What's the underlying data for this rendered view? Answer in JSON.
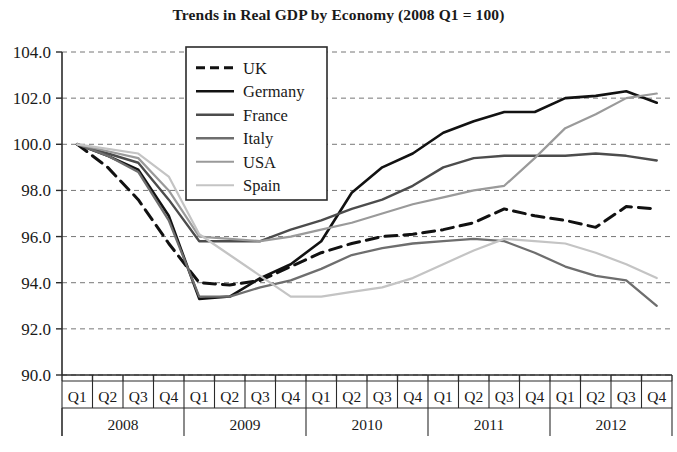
{
  "chart_data": {
    "type": "line",
    "title": "Trends in Real GDP by Economy (2008 Q1 = 100)",
    "xlabel": "",
    "ylabel": "",
    "ylim": [
      90.0,
      104.0
    ],
    "ytick_step": 2.0,
    "grid": true,
    "grid_style": "dotted-horizontal",
    "legend_position": "top-left-inside",
    "ytick_labels": [
      "104.0",
      "102.0",
      "100.0",
      "98.0",
      "96.0",
      "94.0",
      "92.0",
      "90.0"
    ],
    "ytick_values": [
      104.0,
      102.0,
      100.0,
      98.0,
      96.0,
      94.0,
      92.0,
      90.0
    ],
    "quarter_labels": [
      "Q1",
      "Q2",
      "Q3",
      "Q4",
      "Q1",
      "Q2",
      "Q3",
      "Q4",
      "Q1",
      "Q2",
      "Q3",
      "Q4",
      "Q1",
      "Q2",
      "Q3",
      "Q4",
      "Q1",
      "Q2",
      "Q3",
      "Q4"
    ],
    "year_labels": [
      "2008",
      "2009",
      "2010",
      "2011",
      "2012"
    ],
    "x": [
      "2008 Q1",
      "2008 Q2",
      "2008 Q3",
      "2008 Q4",
      "2009 Q1",
      "2009 Q2",
      "2009 Q3",
      "2009 Q4",
      "2010 Q1",
      "2010 Q2",
      "2010 Q3",
      "2010 Q4",
      "2011 Q1",
      "2011 Q2",
      "2011 Q3",
      "2011 Q4",
      "2012 Q1",
      "2012 Q2",
      "2012 Q3",
      "2012 Q4"
    ],
    "series": [
      {
        "name": "UK",
        "color": "#111111",
        "width": 3.0,
        "dash": "12 7",
        "values": [
          100.0,
          99.0,
          97.6,
          95.7,
          94.0,
          93.9,
          94.1,
          94.7,
          95.3,
          95.7,
          96.0,
          96.1,
          96.3,
          96.6,
          97.2,
          96.9,
          96.7,
          96.4,
          97.3,
          97.2
        ]
      },
      {
        "name": "Germany",
        "color": "#121212",
        "width": 2.6,
        "dash": "none",
        "values": [
          100.0,
          99.5,
          98.9,
          96.9,
          93.3,
          93.4,
          94.2,
          94.8,
          95.8,
          97.9,
          99.0,
          99.6,
          100.5,
          101.0,
          101.4,
          101.4,
          102.0,
          102.1,
          102.3,
          101.8
        ]
      },
      {
        "name": "France",
        "color": "#4c4c4c",
        "width": 2.4,
        "dash": "none",
        "values": [
          100.0,
          99.6,
          99.2,
          97.6,
          95.8,
          95.8,
          95.8,
          96.3,
          96.7,
          97.2,
          97.6,
          98.2,
          99.0,
          99.4,
          99.5,
          99.5,
          99.5,
          99.6,
          99.5,
          99.3
        ]
      },
      {
        "name": "Italy",
        "color": "#6e6e6e",
        "width": 2.3,
        "dash": "none",
        "values": [
          100.0,
          99.5,
          98.8,
          96.7,
          93.4,
          93.4,
          93.8,
          94.1,
          94.6,
          95.2,
          95.5,
          95.7,
          95.8,
          95.9,
          95.8,
          95.3,
          94.7,
          94.3,
          94.1,
          93.0
        ]
      },
      {
        "name": "USA",
        "color": "#9a9a9a",
        "width": 2.2,
        "dash": "none",
        "values": [
          100.0,
          99.7,
          99.4,
          98.0,
          96.0,
          95.9,
          95.8,
          96.0,
          96.3,
          96.6,
          97.0,
          97.4,
          97.7,
          98.0,
          98.2,
          99.4,
          100.7,
          101.3,
          102.0,
          102.2
        ]
      },
      {
        "name": "Spain",
        "color": "#c4c4c4",
        "width": 2.2,
        "dash": "none",
        "values": [
          100.0,
          99.8,
          99.6,
          98.6,
          96.1,
          95.2,
          94.3,
          93.4,
          93.4,
          93.6,
          93.8,
          94.2,
          94.8,
          95.4,
          95.9,
          95.8,
          95.7,
          95.3,
          94.8,
          94.2
        ]
      }
    ]
  },
  "legend": {
    "entries": [
      {
        "label": "UK"
      },
      {
        "label": "Germany"
      },
      {
        "label": "France"
      },
      {
        "label": "Italy"
      },
      {
        "label": "USA"
      },
      {
        "label": "Spain"
      }
    ]
  }
}
